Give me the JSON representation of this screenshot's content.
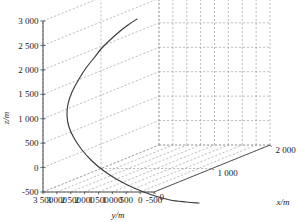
{
  "chart_data": {
    "type": "line",
    "title": "",
    "projection": "3d",
    "xlabel": "x/m",
    "ylabel": "y/m",
    "zlabel": "z/m",
    "xlim": [
      0,
      2000
    ],
    "ylim": [
      -500,
      3500
    ],
    "zlim": [
      -500,
      3000
    ],
    "xticks": [
      "0",
      "1 000",
      "2 000"
    ],
    "yticks": [
      "3 500",
      "3 000",
      "2 500",
      "2 000",
      "1 500",
      "1 000",
      "500",
      "0",
      "-500"
    ],
    "zticks": [
      "3 000",
      "2 500",
      "2 000",
      "1 500",
      "1 000",
      "500",
      "0",
      "-500"
    ],
    "grid": true,
    "legend": null,
    "series": [
      {
        "name": "trajectory",
        "color": "#3a3a3a",
        "comment": "curve arcs up-left from upper right, reaches leftmost extent near z=1500, then descends to the floor at the right",
        "points_px": [
          [
            137,
            19
          ],
          [
            128,
            25
          ],
          [
            119,
            32
          ],
          [
            110,
            40
          ],
          [
            101,
            49
          ],
          [
            94,
            58
          ],
          [
            86,
            68
          ],
          [
            79,
            79
          ],
          [
            72,
            92
          ],
          [
            68,
            104
          ],
          [
            67,
            116
          ],
          [
            69,
            127
          ],
          [
            74,
            138
          ],
          [
            82,
            150
          ],
          [
            92,
            161
          ],
          [
            104,
            171
          ],
          [
            118,
            180
          ],
          [
            134,
            188
          ],
          [
            152,
            195
          ],
          [
            170,
            200
          ],
          [
            186,
            202
          ],
          [
            199,
            203
          ]
        ]
      }
    ]
  },
  "axes": {
    "z_title": "z/m",
    "y_title": "y/m",
    "x_title": "x/m"
  }
}
